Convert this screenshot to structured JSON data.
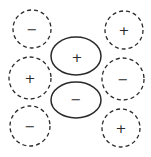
{
  "diagram": {
    "central_lobes": [
      {
        "id": "top",
        "sign": "+",
        "cx": 76,
        "cy": 56,
        "rx": 25,
        "ry": 19
      },
      {
        "id": "bottom",
        "sign": "−",
        "cx": 76,
        "cy": 100,
        "rx": 25,
        "ry": 18
      }
    ],
    "dashed_circles": [
      {
        "id": "top-left",
        "sign": "−",
        "cx": 32,
        "cy": 29,
        "r": 19
      },
      {
        "id": "top-right",
        "sign": "+",
        "cx": 124,
        "cy": 30,
        "r": 19
      },
      {
        "id": "mid-left",
        "sign": "+",
        "cx": 30,
        "cy": 78,
        "r": 21
      },
      {
        "id": "mid-right",
        "sign": "−",
        "cx": 123,
        "cy": 79,
        "r": 21
      },
      {
        "id": "bottom-left",
        "sign": "−",
        "cx": 30,
        "cy": 126,
        "r": 20
      },
      {
        "id": "bottom-right",
        "sign": "+",
        "cx": 121,
        "cy": 128,
        "r": 19
      }
    ]
  }
}
